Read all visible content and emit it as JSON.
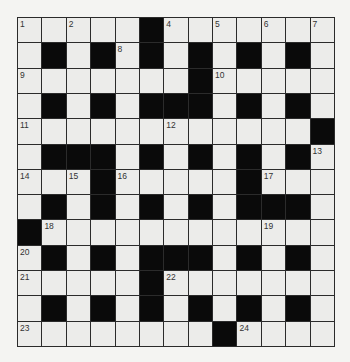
{
  "puzzle": {
    "rows": 13,
    "cols": 13,
    "colors": {
      "background": "#f4f4f2",
      "cell": "#ececea",
      "block": "#0a0a0a",
      "grid_line": "#2b2b2b",
      "number": "#333333"
    },
    "layout": [
      ".....#.......",
      ".#.#.#.#.#.#.",
      ".......#.....",
      ".#.#.###.#.#.",
      "............#",
      ".###.#.#.#.#.",
      "...#.....#...",
      ".#.#.#.#.###.",
      "#............",
      ".#.#.###.#.#.",
      ".....#.......",
      ".#.#.#.#.#.#.",
      "........#...."
    ],
    "numbers": [
      {
        "r": 0,
        "c": 0,
        "n": "1"
      },
      {
        "r": 0,
        "c": 2,
        "n": "2"
      },
      {
        "r": 0,
        "c": 5,
        "n": "3"
      },
      {
        "r": 0,
        "c": 6,
        "n": "4"
      },
      {
        "r": 0,
        "c": 8,
        "n": "5"
      },
      {
        "r": 0,
        "c": 10,
        "n": "6"
      },
      {
        "r": 0,
        "c": 12,
        "n": "7"
      },
      {
        "r": 1,
        "c": 4,
        "n": "8"
      },
      {
        "r": 2,
        "c": 0,
        "n": "9"
      },
      {
        "r": 2,
        "c": 8,
        "n": "10"
      },
      {
        "r": 4,
        "c": 0,
        "n": "11"
      },
      {
        "r": 4,
        "c": 6,
        "n": "12"
      },
      {
        "r": 5,
        "c": 12,
        "n": "13"
      },
      {
        "r": 6,
        "c": 0,
        "n": "14"
      },
      {
        "r": 6,
        "c": 2,
        "n": "15"
      },
      {
        "r": 6,
        "c": 4,
        "n": "16"
      },
      {
        "r": 6,
        "c": 10,
        "n": "17"
      },
      {
        "r": 8,
        "c": 1,
        "n": "18"
      },
      {
        "r": 8,
        "c": 10,
        "n": "19"
      },
      {
        "r": 9,
        "c": 0,
        "n": "20"
      },
      {
        "r": 10,
        "c": 0,
        "n": "21"
      },
      {
        "r": 10,
        "c": 6,
        "n": "22"
      },
      {
        "r": 12,
        "c": 0,
        "n": "23"
      },
      {
        "r": 12,
        "c": 9,
        "n": "24"
      }
    ]
  }
}
